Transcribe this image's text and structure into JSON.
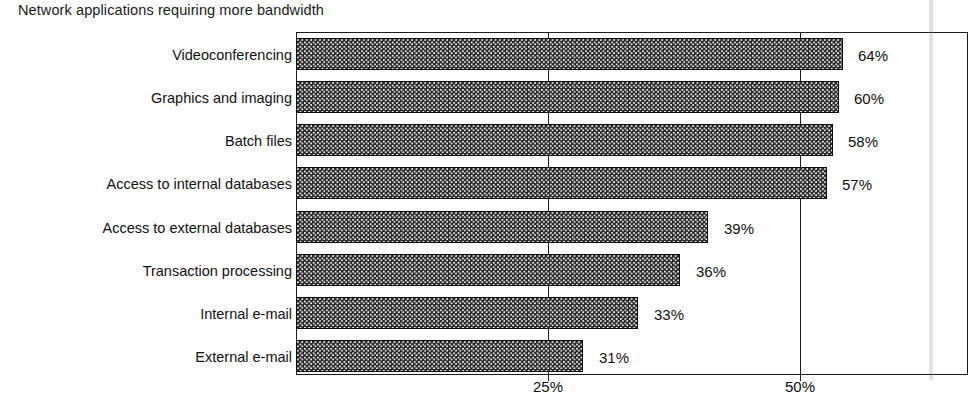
{
  "chart_data": {
    "type": "bar",
    "orientation": "horizontal",
    "title": "Network applications requiring more bandwidth",
    "xlabel": "",
    "ylabel": "",
    "xlim": [
      0,
      66.6
    ],
    "grid": true,
    "legend": false,
    "tick_labels": [
      "25%",
      "50%"
    ],
    "tick_values": [
      25,
      50
    ],
    "categories": [
      "Videoconferencing",
      "Graphics and imaging",
      "Batch files",
      "Access to internal databases",
      "Access to external databases",
      "Transaction processing",
      "Internal e-mail",
      "External e-mail"
    ],
    "values": [
      64,
      60,
      58,
      57,
      39,
      36,
      33,
      31
    ],
    "value_labels": [
      "64%",
      "60%",
      "58%",
      "57%",
      "39%",
      "36%",
      "33%",
      "31%"
    ],
    "bar_color": "#2b2b2b",
    "bar_pattern": "dark-checkered-dots",
    "axis_color": "#1c1c1c",
    "background": "#ffffff"
  },
  "pixels": {
    "bar_end_x": [
      843,
      839,
      833,
      827,
      708,
      680,
      638,
      583
    ],
    "bar_top_y": [
      38,
      81,
      124,
      167,
      211,
      254,
      297,
      340
    ],
    "label_x": [
      858,
      854,
      848,
      842,
      724,
      696,
      654,
      599
    ],
    "grid_x": [
      548,
      800
    ]
  }
}
